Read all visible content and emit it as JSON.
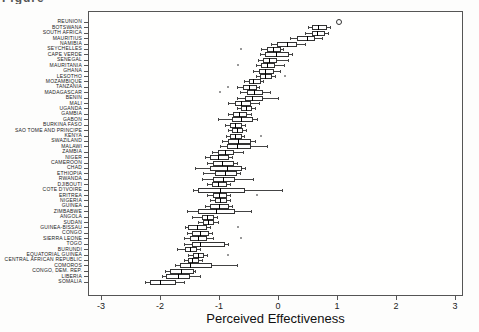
{
  "caption_fragment": "Figure",
  "chart_data": {
    "type": "boxplot",
    "orientation": "horizontal",
    "title": "",
    "xlabel": "Perceived Effectiveness",
    "ylabel": "",
    "xlim": [
      -3.2,
      3.15
    ],
    "xticks": [
      -3,
      -2,
      -1,
      0,
      1,
      2,
      3
    ],
    "grid": false,
    "legend": "none",
    "countries": [
      {
        "name": "REUNION",
        "outliers": [
          1.01
        ]
      },
      {
        "name": "BOTSWANA",
        "wlo": 0.5,
        "q1": 0.57,
        "med": 0.68,
        "q3": 0.8,
        "whi": 0.88,
        "outliers": []
      },
      {
        "name": "SOUTH AFRICA",
        "wlo": 0.46,
        "q1": 0.57,
        "med": 0.66,
        "q3": 0.77,
        "whi": 0.84,
        "outliers": []
      },
      {
        "name": "MAURITIUS",
        "wlo": 0.2,
        "q1": 0.32,
        "med": 0.49,
        "q3": 0.6,
        "whi": 0.74,
        "outliers": []
      },
      {
        "name": "NAMIBIA",
        "wlo": -0.12,
        "q1": -0.02,
        "med": 0.15,
        "q3": 0.29,
        "whi": 0.46,
        "outliers": []
      },
      {
        "name": "SEYCHELLES",
        "wlo": -0.28,
        "q1": -0.19,
        "med": -0.08,
        "q3": 0.01,
        "whi": 0.08,
        "outliers": [
          -0.62
        ]
      },
      {
        "name": "CAPE VERDE",
        "wlo": -0.3,
        "q1": -0.22,
        "med": -0.03,
        "q3": 0.15,
        "whi": 0.24,
        "outliers": []
      },
      {
        "name": "SENEGAL",
        "wlo": -0.34,
        "q1": -0.25,
        "med": -0.15,
        "q3": -0.05,
        "whi": 0.17,
        "outliers": []
      },
      {
        "name": "MAURITANIA",
        "wlo": -0.37,
        "q1": -0.28,
        "med": -0.18,
        "q3": -0.08,
        "whi": 0.1,
        "outliers": [
          -0.68
        ]
      },
      {
        "name": "GHANA",
        "wlo": -0.42,
        "q1": -0.33,
        "med": -0.22,
        "q3": -0.11,
        "whi": 0.03,
        "outliers": []
      },
      {
        "name": "LESOTHO",
        "wlo": -0.38,
        "q1": -0.31,
        "med": -0.22,
        "q3": -0.14,
        "whi": -0.05,
        "outliers": [
          0.12
        ]
      },
      {
        "name": "MOZAMBIQUE",
        "wlo": -0.57,
        "q1": -0.5,
        "med": -0.42,
        "q3": -0.33,
        "whi": -0.25,
        "outliers": []
      },
      {
        "name": "TANZANIA",
        "wlo": -0.7,
        "q1": -0.59,
        "med": -0.49,
        "q3": -0.39,
        "whi": -0.33,
        "outliers": [
          -0.85
        ]
      },
      {
        "name": "MADAGASCAR",
        "wlo": -0.64,
        "q1": -0.53,
        "med": -0.4,
        "q3": -0.28,
        "whi": -0.14,
        "outliers": [
          -0.98
        ]
      },
      {
        "name": "BENIN",
        "wlo": -0.7,
        "q1": -0.56,
        "med": -0.44,
        "q3": -0.28,
        "whi": 0.0,
        "outliers": []
      },
      {
        "name": "MALI",
        "wlo": -0.84,
        "q1": -0.73,
        "med": -0.62,
        "q3": -0.5,
        "whi": -0.33,
        "outliers": []
      },
      {
        "name": "UGANDA",
        "wlo": -0.7,
        "q1": -0.62,
        "med": -0.54,
        "q3": -0.47,
        "whi": -0.39,
        "outliers": []
      },
      {
        "name": "GAMBIA",
        "wlo": -0.84,
        "q1": -0.76,
        "med": -0.66,
        "q3": -0.56,
        "whi": -0.45,
        "outliers": []
      },
      {
        "name": "GABON",
        "wlo": -1.01,
        "q1": -0.78,
        "med": -0.62,
        "q3": -0.45,
        "whi": -0.36,
        "outliers": []
      },
      {
        "name": "BURKINA FASO",
        "wlo": -0.9,
        "q1": -0.81,
        "med": -0.73,
        "q3": -0.64,
        "whi": -0.56,
        "outliers": []
      },
      {
        "name": "SAO TOME AND PRINCIPE",
        "wlo": -0.85,
        "q1": -0.78,
        "med": -0.7,
        "q3": -0.62,
        "whi": -0.54,
        "outliers": []
      },
      {
        "name": "KENYA",
        "wlo": -0.88,
        "q1": -0.81,
        "med": -0.73,
        "q3": -0.64,
        "whi": -0.57,
        "outliers": [
          -0.28
        ]
      },
      {
        "name": "SWAZILAND",
        "wlo": -0.95,
        "q1": -0.84,
        "med": -0.68,
        "q3": -0.5,
        "whi": -0.39,
        "outliers": []
      },
      {
        "name": "MALAWI",
        "wlo": -0.98,
        "q1": -0.87,
        "med": -0.7,
        "q3": -0.5,
        "whi": -0.19,
        "outliers": []
      },
      {
        "name": "ZAMBIA",
        "wlo": -1.12,
        "q1": -1.01,
        "med": -0.9,
        "q3": -0.78,
        "whi": -0.59,
        "outliers": []
      },
      {
        "name": "NIGER",
        "wlo": -1.24,
        "q1": -1.15,
        "med": -1.02,
        "q3": -0.87,
        "whi": -0.78,
        "outliers": []
      },
      {
        "name": "CAMEROON",
        "wlo": -1.2,
        "q1": -1.1,
        "med": -0.95,
        "q3": -0.78,
        "whi": -0.7,
        "outliers": []
      },
      {
        "name": "CHAD",
        "wlo": -1.41,
        "q1": -1.15,
        "med": -0.87,
        "q3": -0.64,
        "whi": -0.56,
        "outliers": []
      },
      {
        "name": "ETHIOPIA",
        "wlo": -1.27,
        "q1": -1.07,
        "med": -0.9,
        "q3": -0.73,
        "whi": -0.64,
        "outliers": []
      },
      {
        "name": "RWANDA",
        "wlo": -1.29,
        "q1": -1.1,
        "med": -0.93,
        "q3": -0.76,
        "whi": -0.42,
        "outliers": []
      },
      {
        "name": "DJIBOUTI",
        "wlo": -1.2,
        "q1": -1.12,
        "med": -1.01,
        "q3": -0.9,
        "whi": -0.81,
        "outliers": []
      },
      {
        "name": "COTE D'IVOIRE",
        "wlo": -1.44,
        "q1": -1.35,
        "med": -0.98,
        "q3": -0.59,
        "whi": 0.06,
        "outliers": []
      },
      {
        "name": "ERITREA",
        "wlo": -1.21,
        "q1": -1.1,
        "med": -1.0,
        "q3": -0.9,
        "whi": -0.81,
        "outliers": [
          -0.36
        ]
      },
      {
        "name": "NIGERIA",
        "wlo": -1.15,
        "q1": -1.07,
        "med": -0.98,
        "q3": -0.9,
        "whi": -0.81,
        "outliers": []
      },
      {
        "name": "GUINEA",
        "wlo": -1.24,
        "q1": -1.15,
        "med": -1.0,
        "q3": -0.87,
        "whi": -0.78,
        "outliers": []
      },
      {
        "name": "ZIMBABWE",
        "wlo": -1.55,
        "q1": -1.35,
        "med": -1.05,
        "q3": -0.76,
        "whi": -0.45,
        "outliers": []
      },
      {
        "name": "ANGOLA",
        "wlo": -1.46,
        "q1": -1.29,
        "med": -1.2,
        "q3": -1.12,
        "whi": -1.04,
        "outliers": []
      },
      {
        "name": "SUDAN",
        "wlo": -1.35,
        "q1": -1.27,
        "med": -1.19,
        "q3": -1.12,
        "whi": -1.02,
        "outliers": []
      },
      {
        "name": "GUINEA-BISSAU",
        "wlo": -1.58,
        "q1": -1.52,
        "med": -1.38,
        "q3": -1.24,
        "whi": -1.15,
        "outliers": [
          -0.67
        ]
      },
      {
        "name": "CONGO",
        "wlo": -1.55,
        "q1": -1.46,
        "med": -1.33,
        "q3": -1.21,
        "whi": -1.12,
        "outliers": []
      },
      {
        "name": "SIERRA LEONE",
        "wlo": -1.6,
        "q1": -1.49,
        "med": -1.36,
        "q3": -1.24,
        "whi": -1.1,
        "outliers": [
          -0.62
        ]
      },
      {
        "name": "TOGO",
        "wlo": -1.6,
        "q1": -1.46,
        "med": -1.32,
        "q3": -0.93,
        "whi": -0.84,
        "outliers": []
      },
      {
        "name": "BURUNDI",
        "wlo": -1.72,
        "q1": -1.58,
        "med": -1.49,
        "q3": -1.41,
        "whi": -1.32,
        "outliers": []
      },
      {
        "name": "EQUATORIAL GUINEA",
        "wlo": -1.52,
        "q1": -1.44,
        "med": -1.36,
        "q3": -1.29,
        "whi": -1.21,
        "outliers": [
          -0.84
        ]
      },
      {
        "name": "CENTRAL AFRICAN REPUBLIC",
        "wlo": -1.6,
        "q1": -1.52,
        "med": -1.45,
        "q3": -1.38,
        "whi": -1.29,
        "outliers": []
      },
      {
        "name": "COMOROS",
        "wlo": -1.75,
        "q1": -1.66,
        "med": -1.49,
        "q3": -1.15,
        "whi": -0.7,
        "outliers": []
      },
      {
        "name": "CONGO, DEM. REP.",
        "wlo": -1.92,
        "q1": -1.83,
        "med": -1.64,
        "q3": -1.46,
        "whi": -1.41,
        "outliers": []
      },
      {
        "name": "LIBERIA",
        "wlo": -1.97,
        "q1": -1.89,
        "med": -1.7,
        "q3": -1.52,
        "whi": -1.32,
        "outliers": []
      },
      {
        "name": "SOMALIA",
        "wlo": -2.25,
        "q1": -2.17,
        "med": -2.0,
        "q3": -1.77,
        "whi": -1.6,
        "outliers": []
      }
    ]
  },
  "style_colors": {
    "background": "#fdfdfc",
    "axis": "#555555",
    "box_border": "#333333",
    "median": "#000000",
    "text": "#222222",
    "outlier": "#777777"
  }
}
